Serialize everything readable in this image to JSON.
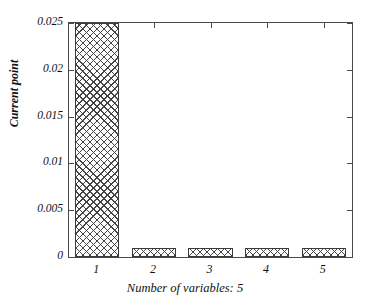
{
  "chart_data": {
    "type": "bar",
    "title": "",
    "subtitle": "",
    "xlabel": "Number of variables: 5",
    "ylabel": "Current point",
    "categories": [
      "1",
      "2",
      "3",
      "4",
      "5"
    ],
    "values": [
      0.025,
      0.001,
      0.001,
      0.001,
      0.001
    ],
    "series": [
      {
        "name": "Current point",
        "values": [
          0.025,
          0.001,
          0.001,
          0.001,
          0.001
        ]
      }
    ],
    "xlim": [
      0.5,
      5.5
    ],
    "ylim": [
      0,
      0.025
    ],
    "ytick_labels": [
      "0",
      "0.005",
      "0.01",
      "0.015",
      "0.02",
      "0.025"
    ],
    "ytick_values": [
      0,
      0.005,
      0.01,
      0.015,
      0.02,
      0.025
    ],
    "xtick_labels": [
      "1",
      "2",
      "3",
      "4",
      "5"
    ],
    "xtick_values": [
      1,
      2,
      3,
      4,
      5
    ],
    "grid": false,
    "legend": null,
    "legend_position": "none",
    "bar_style": {
      "fill": "crosshatch",
      "edge_color": "#3a3a3a",
      "face_color": "#ffffff"
    },
    "axis_color": "#4a4a4a",
    "background_color": "#ffffff",
    "annotations": []
  }
}
